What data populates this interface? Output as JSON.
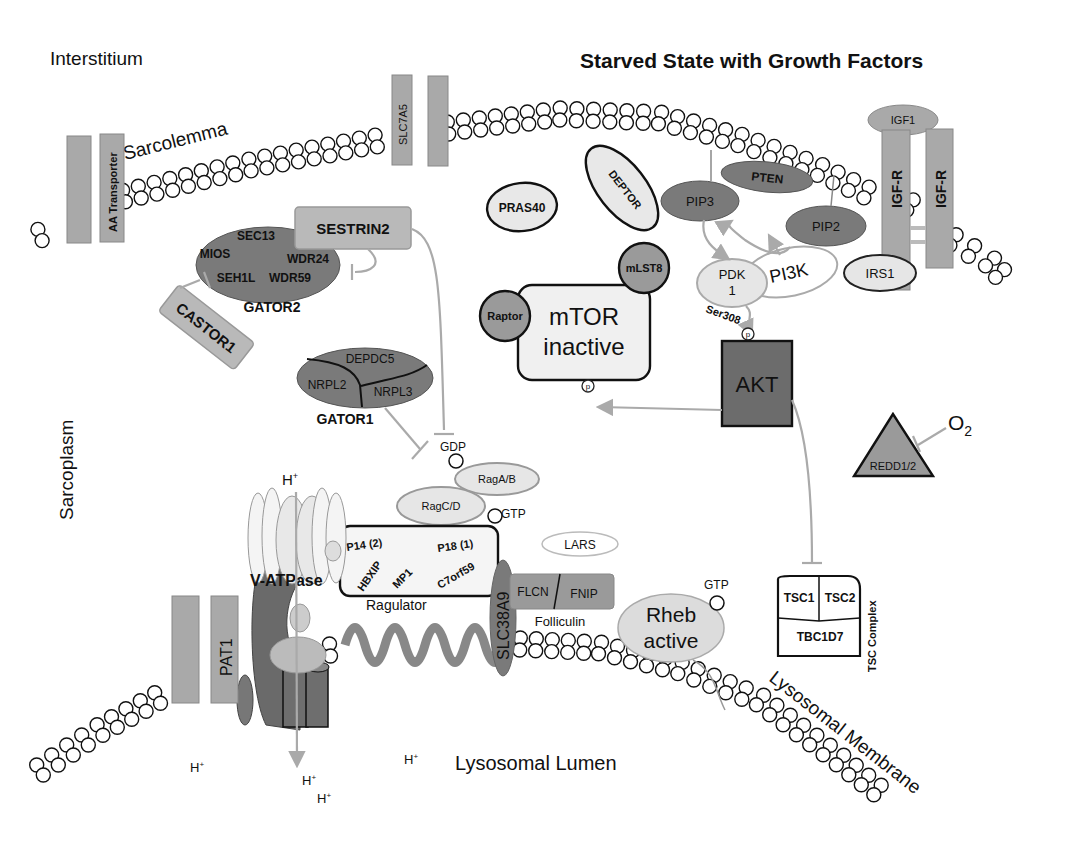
{
  "title": "Starved State with Growth Factors",
  "regions": {
    "interstitium": "Interstitium",
    "sarcoplasm": "Sarcoplasm",
    "lysosomal_lumen": "Lysosomal Lumen",
    "sarcolemma": "Sarcolemma",
    "lysosomal_membrane": "Lysosomal Membrane"
  },
  "transporters": {
    "aa_transporter": "AA Transporter",
    "slc7a5": "SLC7A5",
    "pat1": "PAT1",
    "slc38a9": "SLC38A9"
  },
  "growth_factor": {
    "igf1": "IGF1",
    "igfr_left": "IGF-R",
    "igfr_right": "IGF-R",
    "irs1": "IRS1",
    "pi3k": "PI3K",
    "pip2": "PIP2",
    "pip3": "PIP3",
    "pten": "PTEN",
    "pdk1_line1": "PDK",
    "pdk1_line2": "1",
    "ser308": "Ser308",
    "p": "p",
    "akt": "AKT"
  },
  "mtor": {
    "line1": "mTOR",
    "line2": "inactive",
    "raptor": "Raptor",
    "mlst8": "mLST8",
    "pras40": "PRAS40",
    "deptor": "DEPTOR",
    "p": "p"
  },
  "gator2": {
    "label": "GATOR2",
    "sec13": "SEC13",
    "mios": "MIOS",
    "wdr24": "WDR24",
    "seh1l": "SEH1L",
    "wdr59": "WDR59",
    "sestrin2": "SESTRIN2",
    "castor1": "CASTOR1"
  },
  "gator1": {
    "label": "GATOR1",
    "depdc5": "DEPDC5",
    "nrpl2": "NRPL2",
    "nrpl3": "NRPL3"
  },
  "rag": {
    "gdp": "GDP",
    "gtp": "GTP",
    "ragab": "RagA/B",
    "ragcd": "RagC/D"
  },
  "ragulator": {
    "label": "Ragulator",
    "p14": "P14 (2)",
    "p18": "P18 (1)",
    "hbxip": "HBXIP",
    "mp1": "MP1",
    "c7orf59": "C7orf59"
  },
  "vatpase": {
    "label": "V-ATPase"
  },
  "lars": "LARS",
  "folliculin": {
    "label": "Folliculin",
    "flcn": "FLCN",
    "fnip": "FNIP"
  },
  "rheb": {
    "line1": "Rheb",
    "line2": "active",
    "gtp": "GTP"
  },
  "tsc": {
    "label": "TSC Complex",
    "tsc1": "TSC1",
    "tsc2": "TSC2",
    "tbc1d7": "TBC1D7"
  },
  "redd": {
    "label": "REDD1/2",
    "o2": "O",
    "o2_sub": "2"
  },
  "protons": {
    "h": "H",
    "plus": "+"
  }
}
